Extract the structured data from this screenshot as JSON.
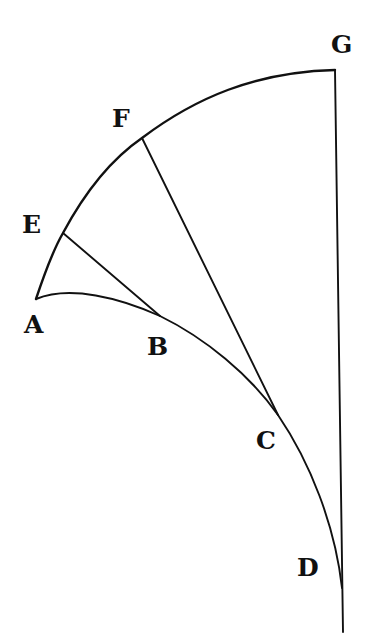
{
  "diagram": {
    "type": "geometric-figure",
    "colors": {
      "ink": "#111111",
      "background": "#ffffff"
    },
    "labels": {
      "A": "A",
      "B": "B",
      "C": "C",
      "D": "D",
      "E": "E",
      "F": "F",
      "G": "G"
    },
    "points": {
      "A": [
        36,
        299
      ],
      "B": [
        160,
        316
      ],
      "C": [
        278,
        415
      ],
      "D": [
        342,
        588
      ],
      "E": [
        63,
        233
      ],
      "F": [
        142,
        138
      ],
      "G": [
        335,
        70
      ]
    },
    "segments": [
      {
        "name": "outer-arc-AEFG",
        "from": "A",
        "to": "G",
        "kind": "curve"
      },
      {
        "name": "inner-curve-ABCD",
        "from": "A",
        "to": "D",
        "kind": "curve"
      },
      {
        "name": "line-EB",
        "from": "E",
        "to": "B",
        "kind": "straight"
      },
      {
        "name": "line-FC",
        "from": "F",
        "to": "C",
        "kind": "straight"
      },
      {
        "name": "line-GD",
        "from": "G",
        "to": "D",
        "kind": "straight",
        "extends_below": true
      }
    ]
  }
}
